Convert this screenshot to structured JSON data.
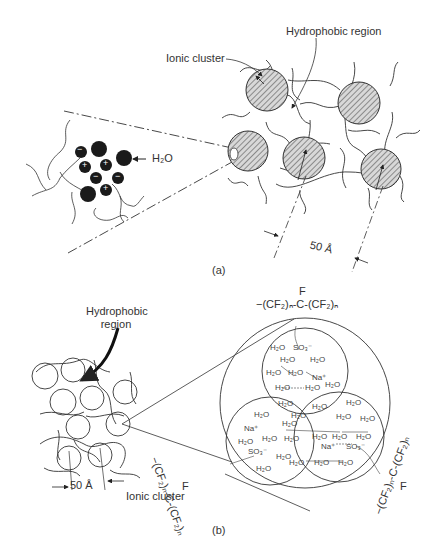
{
  "figure": {
    "panel_a": {
      "caption": "(a)",
      "labels": {
        "hydrophobic_region": "Hydrophobic region",
        "ionic_cluster": "Ionic cluster",
        "water": "H₂O",
        "spacing": "50 Å"
      },
      "ion_charges": [
        "−",
        "+",
        "+",
        "−",
        "−",
        "+"
      ]
    },
    "panel_b": {
      "caption": "(b)",
      "labels": {
        "hydrophobic_region": "Hydrophobic region",
        "ionic_cluster": "Ionic cluster",
        "spacing": "50 Å",
        "chain_top_f": "F",
        "chain_top": "−(CF₂)ₙ-C-(CF₂)ₙ",
        "chain_left": "−(CF₂)ₙ-C-(CF₂)ₙ",
        "chain_left_f": "F",
        "chain_right": "−(CF₂)ₙ-C-(CF₂)ₙ",
        "chain_right_f": "F"
      },
      "cluster_species": {
        "sulfonate": "SO₃⁻",
        "sodium": "Na⁺",
        "water": "H₂O"
      }
    }
  }
}
